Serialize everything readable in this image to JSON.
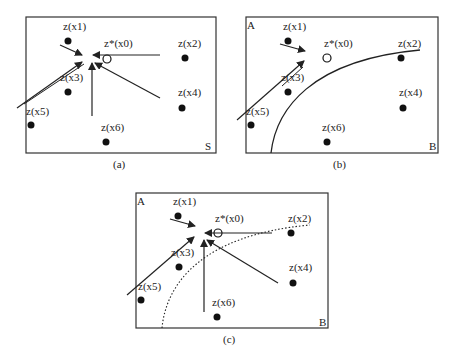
{
  "panels": [
    {
      "id": "a",
      "caption": "(a)",
      "corner_labels": {
        "bottom_right": "S"
      },
      "target": {
        "label": "z*(x0)"
      },
      "points": [
        {
          "label": "z(x1)"
        },
        {
          "label": "z(x2)"
        },
        {
          "label": "z(x3)"
        },
        {
          "label": "z(x4)"
        },
        {
          "label": "z(x5)"
        },
        {
          "label": "z(x6)"
        }
      ],
      "boundary": "none"
    },
    {
      "id": "b",
      "caption": "(b)",
      "corner_labels": {
        "top_left": "A",
        "bottom_right": "B"
      },
      "target": {
        "label": "z*(x0)"
      },
      "points": [
        {
          "label": "z(x1)"
        },
        {
          "label": "z(x2)"
        },
        {
          "label": "z(x3)"
        },
        {
          "label": "z(x4)"
        },
        {
          "label": "z(x5)"
        },
        {
          "label": "z(x6)"
        }
      ],
      "boundary": "solid"
    },
    {
      "id": "c",
      "caption": "(c)",
      "corner_labels": {
        "top_left": "A",
        "bottom_right": "B"
      },
      "target": {
        "label": "z*(x0)"
      },
      "points": [
        {
          "label": "z(x1)"
        },
        {
          "label": "z(x2)"
        },
        {
          "label": "z(x3)"
        },
        {
          "label": "z(x4)"
        },
        {
          "label": "z(x5)"
        },
        {
          "label": "z(x6)"
        }
      ],
      "boundary": "dotted"
    }
  ]
}
